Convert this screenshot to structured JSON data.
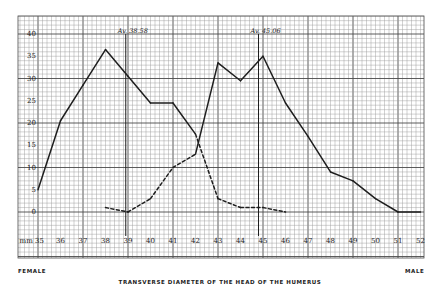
{
  "chart_data": {
    "type": "line",
    "title": "TRANSVERSE DIAMETER OF THE HEAD OF THE HUMERUS",
    "xlabel": "mm",
    "ylabel": "",
    "x": [
      35,
      36,
      37,
      38,
      39,
      40,
      41,
      42,
      43,
      44,
      45,
      46,
      47,
      48,
      49,
      50,
      51,
      52
    ],
    "x_tick_labels": [
      "mm 35",
      "36",
      "37",
      "38",
      "39",
      "40",
      "41",
      "42",
      "43",
      "44",
      "45",
      "46",
      "47",
      "48",
      "49",
      "50",
      "51",
      "52"
    ],
    "y_tick_labels": [
      "0",
      "5",
      "10",
      "15",
      "20",
      "25",
      "30",
      "35",
      "40"
    ],
    "xlim": [
      35,
      52
    ],
    "ylim": [
      0,
      40
    ],
    "grid": true,
    "series": [
      {
        "name": "Female",
        "points": [
          [
            35,
            5
          ],
          [
            36,
            20.5
          ],
          [
            37,
            28.5
          ],
          [
            38,
            36.5
          ],
          [
            39,
            30.5
          ],
          [
            40,
            24.5
          ],
          [
            41,
            24.5
          ],
          [
            42,
            17.5
          ],
          [
            43,
            3
          ],
          [
            44,
            1
          ],
          [
            45,
            1
          ],
          [
            46,
            0
          ]
        ],
        "solid_until_x": 42
      },
      {
        "name": "Male",
        "points": [
          [
            38,
            1
          ],
          [
            39,
            0
          ],
          [
            40,
            3
          ],
          [
            41,
            10
          ],
          [
            42,
            13
          ],
          [
            43,
            33.5
          ],
          [
            44,
            29.5
          ],
          [
            45,
            35
          ],
          [
            46,
            24.5
          ],
          [
            47,
            17
          ],
          [
            48,
            9
          ],
          [
            49,
            7
          ],
          [
            50,
            3
          ],
          [
            51,
            0
          ],
          [
            52,
            0
          ]
        ],
        "solid_from_x": 42
      }
    ],
    "annotations": [
      {
        "text": "Av. 38.58",
        "x": 38.9,
        "type": "vertical-line"
      },
      {
        "text": "Av. 45.06",
        "x": 44.8,
        "type": "vertical-line"
      }
    ],
    "legend": {
      "left_label": "FEMALE",
      "right_label": "MALE",
      "position": "bottom"
    }
  },
  "labels": {
    "female": "FEMALE",
    "male": "MALE",
    "title": "TRANSVERSE DIAMETER OF THE HEAD OF THE HUMERUS"
  },
  "colors": {
    "grid": "#9a9a9a",
    "grid_major": "#4a4a4a",
    "line": "#1e1e1e",
    "background": "#ffffff"
  }
}
